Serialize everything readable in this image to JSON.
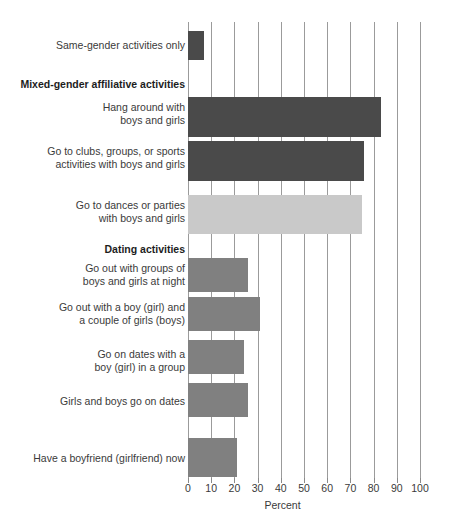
{
  "chart_data": {
    "type": "bar",
    "orientation": "horizontal",
    "title": "",
    "xlabel": "Percent",
    "ylabel": "",
    "xlim": [
      0,
      100
    ],
    "xticks": [
      0,
      10,
      20,
      30,
      40,
      50,
      60,
      70,
      80,
      90,
      100
    ],
    "grid": true,
    "legend": "none",
    "categories": [
      "Same-gender activities only",
      "Hang around with\nboys and girls",
      "Go to clubs, groups, or sports\nactivities with boys and girls",
      "Go to dances or parties\nwith boys and girls",
      "Go out with groups of\nboys and girls at night",
      "Go out with a boy (girl) and\na couple of girls (boys)",
      "Go on dates with a\nboy (girl) in a group",
      "Girls and boys go on dates",
      "Have a boyfriend (girlfriend) now"
    ],
    "values": [
      7,
      83,
      76,
      75,
      26,
      31,
      24,
      26,
      21
    ],
    "section_headings": [
      "Mixed-gender affiliative activities",
      "Dating activities"
    ],
    "bars": [
      {
        "label": "Same-gender activities only",
        "value": 7,
        "color": "#4a4a4a",
        "top": 31,
        "height": 29
      },
      {
        "label": "Hang around with\nboys and girls",
        "value": 83,
        "color": "#4a4a4a",
        "top": 97,
        "height": 40
      },
      {
        "label": "Go to clubs, groups, or sports\nactivities with boys and girls",
        "value": 76,
        "color": "#4a4a4a",
        "top": 141,
        "height": 40
      },
      {
        "label": "Go to dances or parties\nwith boys and girls",
        "value": 75,
        "color": "#c9c9c9",
        "top": 195,
        "height": 39
      },
      {
        "label": "Go out with groups of\nboys and girls at night",
        "value": 26,
        "color": "#808080",
        "top": 258,
        "height": 34
      },
      {
        "label": "Go out with a boy (girl) and\na couple of girls (boys)",
        "value": 31,
        "color": "#808080",
        "top": 297,
        "height": 34
      },
      {
        "label": "Go on dates with a\nboy (girl) in a group",
        "value": 24,
        "color": "#808080",
        "top": 340,
        "height": 34
      },
      {
        "label": "Girls and boys go on dates",
        "value": 26,
        "color": "#808080",
        "top": 383,
        "height": 34
      },
      {
        "label": "Have a boyfriend (girlfriend) now",
        "value": 21,
        "color": "#808080",
        "top": 438,
        "height": 39
      }
    ],
    "colors": {
      "dark_bar": "#4a4a4a",
      "light_bar": "#c9c9c9",
      "medium_bar": "#808080",
      "gridline": "#9b9b9b",
      "text": "#3a3a3a",
      "background": "#ffffff"
    }
  },
  "labels": {
    "row0": "Same-gender activities only",
    "heading0": "Mixed-gender affiliative activities",
    "row1": "Hang around with\nboys and girls",
    "row2": "Go to clubs, groups, or sports\nactivities with boys and girls",
    "row3": "Go to dances or parties\nwith boys and girls",
    "heading1": "Dating activities",
    "row4": "Go out with groups of\nboys and girls at night",
    "row5": "Go out with a boy (girl) and\na couple of girls (boys)",
    "row6": "Go on dates with a\nboy (girl) in a group",
    "row7": "Girls and boys go on dates",
    "row8": "Have a boyfriend (girlfriend) now"
  },
  "axis": {
    "title": "Percent",
    "ticks": [
      "0",
      "10",
      "20",
      "30",
      "40",
      "50",
      "60",
      "70",
      "80",
      "90",
      "100"
    ]
  }
}
